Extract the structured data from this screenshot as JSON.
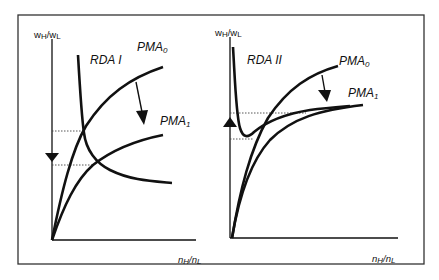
{
  "figure": {
    "border_color": "#333333",
    "curve_color": "#111111",
    "panels": [
      {
        "id": "left",
        "y_axis_label": {
          "main": "w",
          "sub1": "H",
          "sep": "/w",
          "sub2": "L"
        },
        "x_axis_label": {
          "main": "n",
          "sub1": "H",
          "sep": "/n",
          "sub2": "L"
        },
        "curves": [
          {
            "name": "RDA I",
            "label": "RDA I"
          },
          {
            "name": "PMA0",
            "label_main": "PMA",
            "label_sub": "0"
          },
          {
            "name": "PMA1",
            "label_main": "PMA",
            "label_sub": "1"
          }
        ],
        "shift_arrow": "down",
        "axis_arrow": "down"
      },
      {
        "id": "right",
        "y_axis_label": {
          "main": "w",
          "sub1": "H",
          "sep": "/w",
          "sub2": "L"
        },
        "x_axis_label": {
          "main": "n",
          "sub1": "H",
          "sep": "/n",
          "sub2": "L"
        },
        "curves": [
          {
            "name": "RDA II",
            "label": "RDA II"
          },
          {
            "name": "PMA0",
            "label_main": "PMA",
            "label_sub": "0"
          },
          {
            "name": "PMA1",
            "label_main": "PMA",
            "label_sub": "1"
          }
        ],
        "shift_arrow": "down",
        "axis_arrow": "up"
      }
    ]
  }
}
